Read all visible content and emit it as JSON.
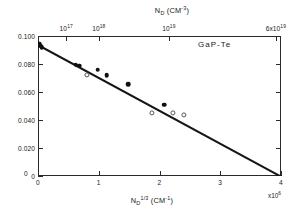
{
  "chart_data": {
    "type": "scatter",
    "title": "",
    "sample_label": "GaP-Te",
    "xlabel": "N_D^1/3 (cm^-1)",
    "ylabel": "E_D (eV)",
    "top_axis_label": "N_D (cm^-3)",
    "grid": false,
    "legend": null,
    "xlim": [
      0,
      4
    ],
    "ylim": [
      0,
      0.1
    ],
    "x_multiplier": "x10^6",
    "x_ticks": [
      {
        "value": 0,
        "label": "0"
      },
      {
        "value": 1,
        "label": "1"
      },
      {
        "value": 2,
        "label": "2"
      },
      {
        "value": 3,
        "label": "3"
      },
      {
        "value": 4,
        "label": "4"
      }
    ],
    "y_ticks": [
      {
        "value": 0.0,
        "label": "0"
      },
      {
        "value": 0.02,
        "label": "0.020"
      },
      {
        "value": 0.04,
        "label": "0.040"
      },
      {
        "value": 0.06,
        "label": "0.060"
      },
      {
        "value": 0.08,
        "label": "0.080"
      },
      {
        "value": 0.1,
        "label": "0.100"
      }
    ],
    "top_ticks": [
      {
        "x": 0.4642,
        "label": "10^17",
        "mantissa": "10",
        "exponent": "17"
      },
      {
        "x": 1.0,
        "label": "10^18",
        "mantissa": "10",
        "exponent": "18"
      },
      {
        "x": 2.1544,
        "label": "10^19",
        "mantissa": "10",
        "exponent": "19"
      },
      {
        "x": 3.9149,
        "label": "6x10^19",
        "mantissa": "6x10",
        "exponent": "19"
      }
    ],
    "fit_line": {
      "intercept_ev": 0.094,
      "x_zero_crossing": 4.0,
      "slope_ev_per_unit": -0.0235,
      "style": "solid"
    },
    "series": [
      {
        "name": "filled-circles",
        "marker": "filled-circle",
        "points": [
          {
            "x": 0.02,
            "y": 0.0945
          },
          {
            "x": 0.04,
            "y": 0.0932
          },
          {
            "x": 0.06,
            "y": 0.092
          },
          {
            "x": 0.62,
            "y": 0.0795
          },
          {
            "x": 0.68,
            "y": 0.0788
          },
          {
            "x": 0.98,
            "y": 0.076
          },
          {
            "x": 1.13,
            "y": 0.0718
          },
          {
            "x": 1.48,
            "y": 0.0655
          },
          {
            "x": 2.08,
            "y": 0.0508
          }
        ]
      },
      {
        "name": "open-circles",
        "marker": "open-circle",
        "points": [
          {
            "x": 0.8,
            "y": 0.0722
          },
          {
            "x": 1.88,
            "y": 0.0452
          },
          {
            "x": 2.22,
            "y": 0.0448
          },
          {
            "x": 2.4,
            "y": 0.0438
          }
        ]
      }
    ]
  }
}
